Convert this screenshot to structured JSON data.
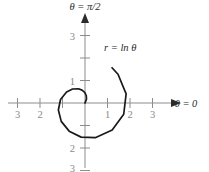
{
  "figure": {
    "background_color": "#ffffff",
    "curve_color": "#1a1a1a",
    "axis_color": "#8d8d8d",
    "ticklabel_color": "#8a8a8a",
    "axis_label_right": "θ = 0",
    "axis_label_top": "θ = π/2",
    "equation_label": "r = ln θ"
  },
  "axis_labels": {
    "x_left": [
      "3",
      "2"
    ],
    "x_right": [
      "1",
      "2",
      "3"
    ],
    "y_up": [
      "1",
      "3"
    ],
    "y_down": [
      "2",
      "3"
    ]
  },
  "chart_data": {
    "type": "line",
    "title": "",
    "subtitle": "",
    "xlabel": "θ = 0",
    "ylabel": "θ = π/2",
    "annotations": [
      "r = ln θ"
    ],
    "coordinate_system": "polar",
    "equation": "r = ln(theta)",
    "grid": false,
    "legend": null,
    "xlim": [
      -3.7,
      3.7
    ],
    "ylim": [
      -3.2,
      3.4
    ],
    "xticks": [
      -3,
      -2,
      -1,
      1,
      2,
      3
    ],
    "yticks": [
      -3,
      -2,
      -1,
      1,
      3
    ],
    "xtick_labels": [
      "3",
      "2",
      "",
      "1",
      "2",
      "3"
    ],
    "ytick_labels": [
      "3",
      "2",
      "",
      "1",
      "",
      "3"
    ],
    "theta_range": [
      1.0,
      7.2
    ],
    "series": [
      {
        "name": "r = ln θ",
        "polar_points": [
          {
            "theta": 1.0,
            "r": 0.0
          },
          {
            "theta": 1.2,
            "r": 0.182
          },
          {
            "theta": 1.4,
            "r": 0.336
          },
          {
            "theta": 1.6,
            "r": 0.47
          },
          {
            "theta": 1.8,
            "r": 0.588
          },
          {
            "theta": 2.0,
            "r": 0.693
          },
          {
            "theta": 2.3,
            "r": 0.833
          },
          {
            "theta": 2.6,
            "r": 0.956
          },
          {
            "theta": 3.0,
            "r": 1.099
          },
          {
            "theta": 3.4,
            "r": 1.224
          },
          {
            "theta": 3.8,
            "r": 1.335
          },
          {
            "theta": 4.2,
            "r": 1.435
          },
          {
            "theta": 4.6,
            "r": 1.526
          },
          {
            "theta": 5.0,
            "r": 1.609
          },
          {
            "theta": 5.5,
            "r": 1.705
          },
          {
            "theta": 6.0,
            "r": 1.792
          },
          {
            "theta": 6.5,
            "r": 1.872
          },
          {
            "theta": 7.0,
            "r": 1.946
          },
          {
            "theta": 7.2,
            "r": 1.974
          }
        ]
      }
    ]
  }
}
